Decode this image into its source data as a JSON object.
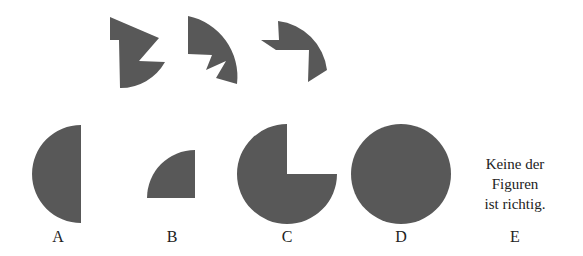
{
  "puzzle": {
    "pieces": [
      {
        "id": "piece-1",
        "points": "110,17 159,38 139,61 165,62 A 51 51 0 0 1 120,88 L 119,40 110,40"
      },
      {
        "id": "piece-2",
        "points": "188,16 A 62 62 0 0 1 237,84 L 216,78 226,61 206,70 212,55 188,54"
      },
      {
        "id": "piece-3",
        "points": "278,21 A 56 56 0 0 1 327,70 L 308,82 309,50 276,50 261,40 279,40"
      }
    ],
    "fill_color": "#585858",
    "options": [
      {
        "letter": "A",
        "shape": "half-circle-left"
      },
      {
        "letter": "B",
        "shape": "quarter-circle"
      },
      {
        "letter": "C",
        "shape": "three-quarter-circle"
      },
      {
        "letter": "D",
        "shape": "full-circle"
      },
      {
        "letter": "E",
        "shape": "text",
        "text_lines": [
          "Keine der",
          "Figuren",
          "ist richtig."
        ]
      }
    ]
  }
}
